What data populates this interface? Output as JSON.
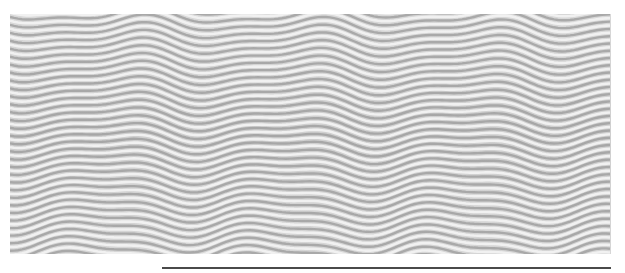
{
  "image": {
    "subject": "wavy-striped-texture",
    "description": "Photograph of a gray and white wavy ribbed surface",
    "colors": {
      "background": "#ffffff",
      "stripe_light": "#f2f2f2",
      "stripe_mid": "#c8c8c8",
      "stripe_dark": "#9a9a9a",
      "rule": "#4a4a4a"
    }
  },
  "rule": {
    "color": "#4a4a4a"
  }
}
